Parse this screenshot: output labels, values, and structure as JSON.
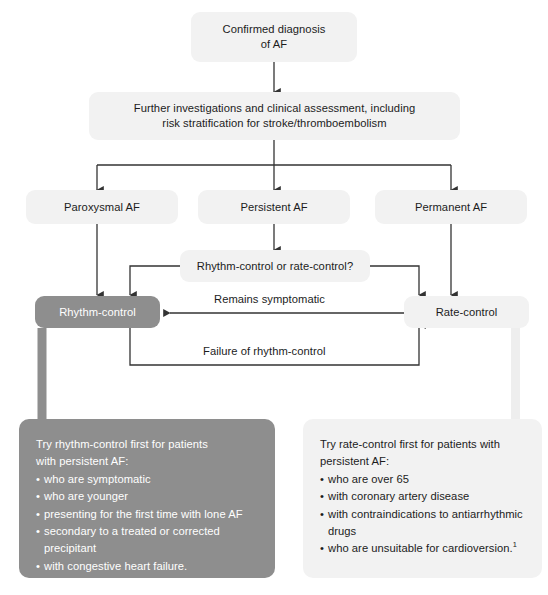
{
  "diagram": {
    "colors": {
      "accent_gray": "#8e8e8e",
      "light_box": "#f2f2f2",
      "line": "#333333",
      "light_connector": "#e8e8e8",
      "text_dark": "#1c1c1c",
      "text_light": "#ffffff"
    },
    "nodes": {
      "confirmed_diagnosis": "Confirmed diagnosis\nof AF",
      "confirmed_diagnosis_line1": "Confirmed diagnosis",
      "confirmed_diagnosis_line2": "of AF",
      "further_investigations_line1": "Further investigations and clinical assessment, including",
      "further_investigations_line2": "risk stratification for stroke/thromboembolism",
      "paroxysmal_af": "Paroxysmal AF",
      "persistent_af": "Persistent AF",
      "permanent_af": "Permanent AF",
      "decision": "Rhythm-control or rate-control?",
      "rhythm_control": "Rhythm-control",
      "rate_control": "Rate-control"
    },
    "edge_labels": {
      "remains_symptomatic": "Remains symptomatic",
      "failure_of_rhythm_control": "Failure of rhythm-control"
    },
    "panels": {
      "rhythm": {
        "lead_line1": "Try rhythm-control first for patients",
        "lead_line2": "with persistent AF:",
        "items": [
          {
            "text": "who are symptomatic",
            "continuation": false
          },
          {
            "text": "who are younger",
            "continuation": false
          },
          {
            "text": "presenting for the first time with lone AF",
            "continuation": false
          },
          {
            "text": "secondary to a treated or corrected",
            "continuation": false
          },
          {
            "text": "precipitant",
            "continuation": true
          },
          {
            "text": "with congestive heart failure.",
            "continuation": false
          }
        ]
      },
      "rate": {
        "lead_line1": "Try rate-control first for patients with",
        "lead_line2": "persistent AF:",
        "items": [
          {
            "text": "who are over 65",
            "continuation": false,
            "footnote": ""
          },
          {
            "text": "with coronary artery disease",
            "continuation": false,
            "footnote": ""
          },
          {
            "text": "with contraindications to antiarrhythmic",
            "continuation": false,
            "footnote": ""
          },
          {
            "text": "drugs",
            "continuation": true,
            "footnote": ""
          },
          {
            "text": "who are unsuitable for cardioversion.",
            "continuation": false,
            "footnote": "1"
          }
        ]
      }
    }
  }
}
